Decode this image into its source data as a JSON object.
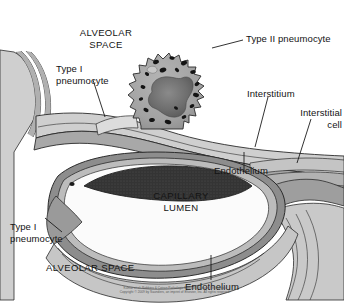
{
  "figure": {
    "labels": [
      {
        "id": "alveolar-space-top",
        "text": "ALVEOLAR\nSPACE",
        "style": "caps"
      },
      {
        "id": "type-ii-pneumocyte",
        "text": "Type II pneumocyte",
        "style": "normal"
      },
      {
        "id": "type-i-pneumocyte-top",
        "text": "Type I\npneumocyte",
        "style": "normal"
      },
      {
        "id": "interstitium",
        "text": "Interstitium",
        "style": "normal"
      },
      {
        "id": "interstitial-cell",
        "text": "Interstitial\ncell",
        "style": "normal"
      },
      {
        "id": "endothelium-right",
        "text": "Endothelium",
        "style": "normal"
      },
      {
        "id": "capillary-lumen",
        "text": "CAPILLARY\nLUMEN",
        "style": "caps"
      },
      {
        "id": "type-i-pneumocyte-bottom",
        "text": "Type I\npneumocyte",
        "style": "normal"
      },
      {
        "id": "alveolar-space-bottom",
        "text": "ALVEOLAR SPACE",
        "style": "caps"
      },
      {
        "id": "endothelium-bottom",
        "text": "Endothelium",
        "style": "normal"
      }
    ],
    "credit": "Kumar et al: Robbins & Cotran Pathologic Basis of Disease, 8th Edition.\nCopyright © 2009 by Saunders, an imprint of Elsevier, Inc. All rights reserved.",
    "colors": {
      "background": "#ffffff",
      "outline": "#2b2b2b",
      "tissue_light": "#d8d8d8",
      "tissue_mid": "#b8b8b8",
      "tissue_dark": "#8f8f8f",
      "cell_body": "#a6a6a6",
      "nucleus": "#6e6e6e",
      "granule": "#141414",
      "erythrocyte": "#3a3a3a",
      "lumen": "#fbfbfb",
      "label_text": "#131313"
    }
  }
}
